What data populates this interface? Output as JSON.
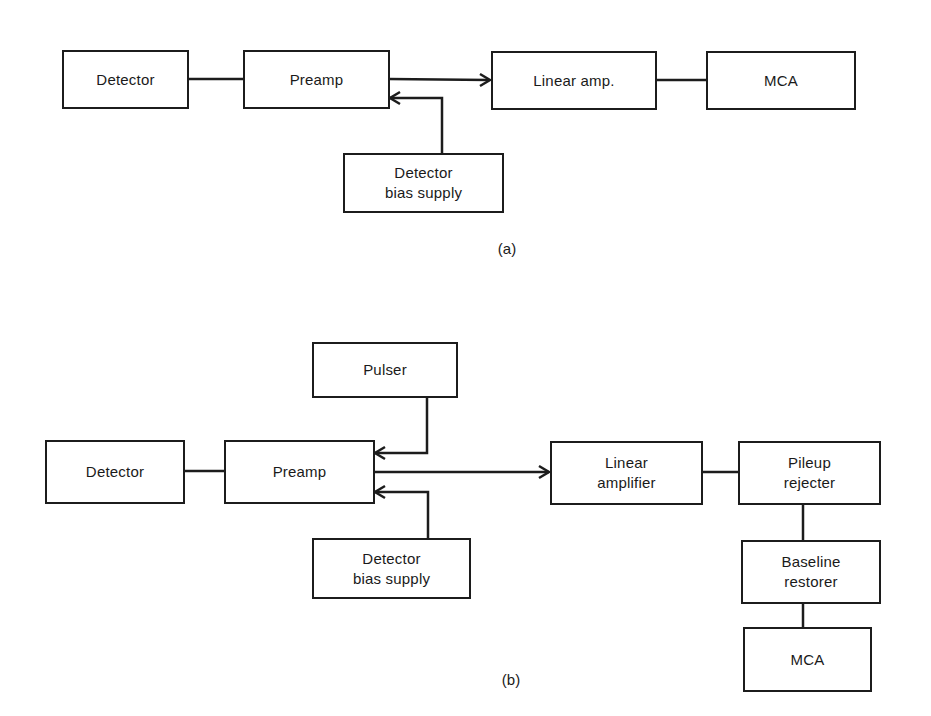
{
  "diagram_a": {
    "caption": "(a)",
    "blocks": {
      "detector": "Detector",
      "preamp": "Preamp",
      "linear_amp": "Linear amp.",
      "mca": "MCA",
      "bias_supply": "Detector\nbias supply"
    },
    "connections": [
      {
        "from": "Detector",
        "to": "Preamp",
        "arrow": false
      },
      {
        "from": "Preamp",
        "to": "Linear amp.",
        "arrow": true
      },
      {
        "from": "Detector bias supply",
        "to": "Preamp",
        "arrow": true
      },
      {
        "from": "Linear amp.",
        "to": "MCA",
        "arrow": false
      }
    ]
  },
  "diagram_b": {
    "caption": "(b)",
    "blocks": {
      "pulser": "Pulser",
      "detector": "Detector",
      "preamp": "Preamp",
      "bias_supply": "Detector\nbias supply",
      "linear_amplifier": "Linear\namplifier",
      "pileup_rejecter": "Pileup\nrejecter",
      "baseline_restorer": "Baseline\nrestorer",
      "mca": "MCA"
    },
    "connections": [
      {
        "from": "Detector",
        "to": "Preamp",
        "arrow": false
      },
      {
        "from": "Pulser",
        "to": "Preamp",
        "arrow": true
      },
      {
        "from": "Detector bias supply",
        "to": "Preamp",
        "arrow": true
      },
      {
        "from": "Preamp",
        "to": "Linear amplifier",
        "arrow": true
      },
      {
        "from": "Linear amplifier",
        "to": "Pileup rejecter",
        "arrow": false
      },
      {
        "from": "Pileup rejecter",
        "to": "Baseline restorer",
        "arrow": false
      },
      {
        "from": "Baseline restorer",
        "to": "MCA",
        "arrow": false
      }
    ]
  }
}
